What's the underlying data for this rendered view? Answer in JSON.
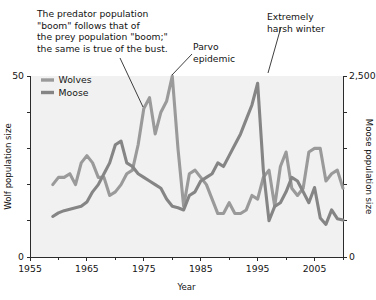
{
  "chart_data": {
    "type": "line",
    "title": "",
    "xlabel": "Year",
    "ylabel": "Wolf population size",
    "y2label": "Moose population size",
    "xlim": [
      1955,
      2010
    ],
    "ylim": [
      0,
      50
    ],
    "y2lim": [
      0,
      2500
    ],
    "grid": false,
    "legend_position": "top-left-inside",
    "x_ticks": [
      1955,
      1965,
      1975,
      1985,
      1995,
      2005
    ],
    "x_tick_labels": [
      "1955",
      "1965",
      "1975",
      "1985",
      "1995",
      "2005"
    ],
    "x_minor_ticks": [
      1960,
      1970,
      1980,
      1990,
      2000,
      2010
    ],
    "y_ticks": [
      0,
      10,
      20,
      30,
      40,
      50
    ],
    "y_tick_labels": [
      "0",
      "",
      "",
      "",
      "",
      "50"
    ],
    "y2_ticks": [
      0,
      500,
      1000,
      1500,
      2000,
      2500
    ],
    "y2_tick_labels": [
      "0",
      "",
      "",
      "",
      "",
      "2,500"
    ],
    "x": [
      1959,
      1960,
      1961,
      1962,
      1963,
      1964,
      1965,
      1966,
      1967,
      1968,
      1969,
      1970,
      1971,
      1972,
      1973,
      1974,
      1975,
      1976,
      1977,
      1978,
      1979,
      1980,
      1981,
      1982,
      1983,
      1984,
      1985,
      1986,
      1987,
      1988,
      1989,
      1990,
      1991,
      1992,
      1993,
      1994,
      1995,
      1996,
      1997,
      1998,
      1999,
      2000,
      2001,
      2002,
      2003,
      2004,
      2005,
      2006,
      2007,
      2008,
      2009,
      2010
    ],
    "series": [
      {
        "name": "Wolves",
        "axis": "left",
        "color": "#9a9a9a",
        "units": "wolves",
        "values": [
          20,
          22,
          22,
          23,
          20,
          26,
          28,
          26,
          22,
          22,
          17,
          18,
          20,
          23,
          24,
          31,
          41,
          44,
          34,
          40,
          43,
          50,
          30,
          14,
          23,
          24,
          22,
          20,
          16,
          12,
          12,
          15,
          12,
          12,
          13,
          17,
          16,
          22,
          24,
          14,
          25,
          29,
          19,
          17,
          19,
          29,
          30,
          30,
          21,
          23,
          24,
          19
        ]
      },
      {
        "name": "Moose",
        "axis": "right",
        "color": "#858585",
        "units": "moose",
        "values": [
          560,
          610,
          640,
          660,
          680,
          700,
          760,
          900,
          1000,
          1150,
          1300,
          1550,
          1600,
          1300,
          1250,
          1150,
          1100,
          1050,
          1000,
          950,
          800,
          700,
          680,
          650,
          850,
          900,
          1050,
          1100,
          1150,
          1300,
          1250,
          1400,
          1550,
          1700,
          1900,
          2100,
          2400,
          1200,
          500,
          700,
          750,
          900,
          1100,
          1050,
          900,
          750,
          960,
          540,
          450,
          650,
          530,
          510
        ]
      }
    ],
    "annotations": [
      {
        "id": "boom-bust-note",
        "lines": [
          "The predator population",
          "\"boom\" follows that of",
          "the prey population \"boom;\"",
          "the same is true of the bust."
        ],
        "points_to": {
          "series": "Wolves",
          "year": 1976,
          "value": 44
        }
      },
      {
        "id": "parvo-epidemic",
        "lines": [
          "Parvo",
          "epidemic"
        ],
        "points_to": {
          "series": "Wolves",
          "year": 1980,
          "value": 50
        }
      },
      {
        "id": "harsh-winter",
        "lines": [
          "Extremely",
          "harsh winter"
        ],
        "points_to": {
          "series": "Moose",
          "year": 1995,
          "value": 2400
        }
      }
    ]
  },
  "legend": {
    "items": [
      {
        "label": "Wolves",
        "color": "#9a9a9a"
      },
      {
        "label": "Moose",
        "color": "#858585"
      }
    ]
  },
  "colors": {
    "wolves": "#9a9a9a",
    "moose": "#858585",
    "axis": "#2b2b2b",
    "text": "#121212",
    "plot_background": "#f1f1f1",
    "page_background": "#ffffff"
  }
}
